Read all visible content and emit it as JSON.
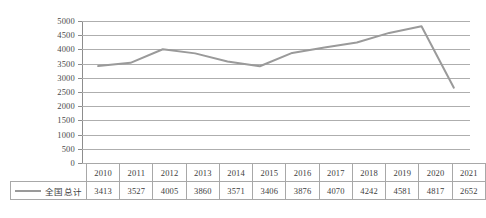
{
  "chart_data": {
    "type": "line",
    "title": "",
    "xlabel": "",
    "ylabel": "",
    "categories": [
      "2010",
      "2011",
      "2012",
      "2013",
      "2014",
      "2015",
      "2016",
      "2017",
      "2018",
      "2019",
      "2020",
      "2021"
    ],
    "series": [
      {
        "name": "全国总计",
        "values": [
          3413,
          3527,
          4005,
          3860,
          3571,
          3406,
          3876,
          4070,
          4242,
          4581,
          4817,
          2652
        ],
        "color": "#9a9a9a"
      }
    ],
    "ylim": [
      0,
      5000
    ],
    "ytick_step": 500,
    "yticks": [
      "5000",
      "4500",
      "4000",
      "3500",
      "3000",
      "2500",
      "2000",
      "1500",
      "1000",
      "500",
      "0"
    ],
    "grid": true,
    "legend_position": "table-left",
    "has_data_table": true
  },
  "table": {
    "corner_label": "",
    "legend_label": "全国总计",
    "header_row": [
      "2010",
      "2011",
      "2012",
      "2013",
      "2014",
      "2015",
      "2016",
      "2017",
      "2018",
      "2019",
      "2020",
      "2021"
    ],
    "value_row": [
      "3413",
      "3527",
      "4005",
      "3860",
      "3571",
      "3406",
      "3876",
      "4070",
      "4242",
      "4581",
      "4817",
      "2652"
    ]
  },
  "colors": {
    "series_line": "#9a9a9a",
    "gridline": "#aeaeae",
    "axis": "#8d8d8d",
    "text": "#3d3d3d",
    "background": "#ffffff"
  }
}
